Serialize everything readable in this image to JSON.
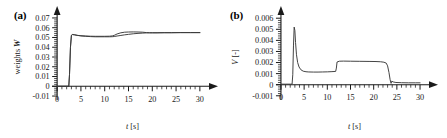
{
  "figure": {
    "background": "#ffffff",
    "line_color": "#3a3a3a",
    "axis_color": "#1a1a1a"
  },
  "chart_data": [
    {
      "panel": "a",
      "tag": "(a)",
      "type": "line",
      "title": "",
      "xlabel": "t [s]",
      "xlabel_italic_part": "t",
      "xlabel_rest": " [s]",
      "ylabel": "weights W",
      "ylabel_plain": "weights ",
      "ylabel_symbol": "W",
      "xlim": [
        -1.5,
        31.5
      ],
      "ylim": [
        -0.012,
        0.072
      ],
      "xticks": [
        0,
        5,
        10,
        15,
        20,
        25,
        30
      ],
      "xticklabels": [
        "0",
        "5",
        "10",
        "15",
        "20",
        "25",
        "30"
      ],
      "xminor_step": 1,
      "yticks": [
        -0.01,
        0,
        0.01,
        0.02,
        0.03,
        0.04,
        0.05,
        0.06,
        0.07
      ],
      "yticklabels": [
        "-0.01",
        "0",
        "0.01",
        "0.02",
        "0.03",
        "0.04",
        "0.05",
        "0.06",
        "0.07"
      ],
      "yminor_step": 0.002,
      "grid": false,
      "legend": "none",
      "axis_arrows": true,
      "series": [
        {
          "name": "weight-curve-upper",
          "x": [
            0,
            1.0,
            2.0,
            2.45,
            2.6,
            2.8,
            3.0,
            3.2,
            3.6,
            4.2,
            5.0,
            6.0,
            7.0,
            8.0,
            9.0,
            10.0,
            11.0,
            11.6,
            12.0,
            12.6,
            13.4,
            14.2,
            15.0,
            16.0,
            17.0,
            18.0,
            18.8,
            19.4,
            20.0,
            21.0,
            22.5,
            24.0,
            26.0,
            28.0,
            30.0
          ],
          "y": [
            0.0,
            0.0,
            0.0,
            0.0,
            0.012,
            0.04,
            0.0522,
            0.053,
            0.0528,
            0.0522,
            0.0518,
            0.0515,
            0.0513,
            0.0512,
            0.0512,
            0.0512,
            0.0513,
            0.0516,
            0.0522,
            0.0536,
            0.0548,
            0.0554,
            0.0556,
            0.0557,
            0.0556,
            0.0554,
            0.055,
            0.0548,
            0.0548,
            0.0548,
            0.0549,
            0.0549,
            0.055,
            0.055,
            0.055
          ]
        },
        {
          "name": "weight-curve-lower",
          "x": [
            0,
            1.0,
            2.0,
            2.45,
            2.6,
            2.8,
            3.0,
            3.2,
            3.6,
            4.2,
            5.0,
            6.0,
            7.0,
            8.0,
            9.0,
            10.0,
            11.0,
            11.6,
            12.0,
            12.6,
            13.4,
            14.2,
            15.0,
            16.0,
            17.0,
            18.0,
            18.8,
            19.4,
            20.0,
            21.0,
            22.5,
            24.0,
            26.0,
            28.0,
            30.0
          ],
          "y": [
            0.0,
            0.0,
            0.0,
            0.0,
            0.012,
            0.04,
            0.0522,
            0.053,
            0.0528,
            0.0522,
            0.0516,
            0.0512,
            0.0509,
            0.0507,
            0.0507,
            0.0507,
            0.0507,
            0.0508,
            0.051,
            0.0515,
            0.0521,
            0.0527,
            0.0532,
            0.0538,
            0.0542,
            0.0545,
            0.0547,
            0.0548,
            0.0548,
            0.0548,
            0.0549,
            0.0549,
            0.055,
            0.055,
            0.055
          ]
        }
      ]
    },
    {
      "panel": "b",
      "tag": "(b)",
      "type": "line",
      "title": "",
      "xlabel": "t [s]",
      "xlabel_italic_part": "t",
      "xlabel_rest": " [s]",
      "ylabel": "V [-]",
      "ylabel_symbol": "V",
      "ylabel_unit": " [-]",
      "xlim": [
        -1.5,
        31.5
      ],
      "ylim": [
        -0.0012,
        0.0062
      ],
      "xticks": [
        0,
        5,
        10,
        15,
        20,
        25,
        30
      ],
      "xticklabels": [
        "0",
        "5",
        "10",
        "15",
        "20",
        "25",
        "30"
      ],
      "xminor_step": 1,
      "yticks": [
        -0.001,
        0,
        0.001,
        0.002,
        0.003,
        0.004,
        0.005,
        0.006
      ],
      "yticklabels": [
        "-0.001",
        "0",
        "0.001",
        "0.002",
        "0.003",
        "0.004",
        "0.005",
        "0.006"
      ],
      "yminor_step": 0.0002,
      "grid": false,
      "legend": "none",
      "axis_arrows": true,
      "series": [
        {
          "name": "v-curve",
          "x": [
            0,
            1.0,
            2.0,
            2.4,
            2.55,
            2.7,
            2.85,
            3.0,
            3.15,
            3.35,
            3.6,
            3.9,
            4.3,
            4.8,
            5.4,
            6.0,
            7.0,
            8.0,
            9.0,
            10.0,
            11.0,
            11.8,
            11.95,
            12.1,
            12.6,
            13.5,
            15.0,
            17.0,
            19.0,
            20.5,
            21.5,
            22.2,
            22.7,
            23.0,
            23.3,
            23.55,
            23.75,
            23.9,
            24.2,
            24.8,
            26.0,
            27.5,
            29.0,
            30.0
          ],
          "y": [
            5e-05,
            5e-05,
            5e-05,
            5e-05,
            0.0009,
            0.0035,
            0.0052,
            0.0049,
            0.0038,
            0.0027,
            0.002,
            0.0016,
            0.00135,
            0.00122,
            0.00117,
            0.00115,
            0.00114,
            0.00114,
            0.00115,
            0.00116,
            0.00118,
            0.0012,
            0.0015,
            0.00205,
            0.00212,
            0.00213,
            0.00212,
            0.00211,
            0.0021,
            0.00209,
            0.00207,
            0.00203,
            0.00195,
            0.0017,
            0.0011,
            0.00045,
            0.00012,
            0.00032,
            0.00025,
            0.0002,
            0.00018,
            0.00017,
            0.00017,
            0.00017
          ]
        }
      ]
    }
  ]
}
